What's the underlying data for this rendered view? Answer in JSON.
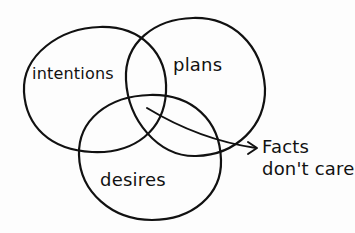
{
  "diagram": {
    "type": "venn",
    "circles": [
      {
        "id": "intentions",
        "label": "intentions"
      },
      {
        "id": "plans",
        "label": "plans"
      },
      {
        "id": "desires",
        "label": "desires"
      }
    ],
    "callout": {
      "line1": "Facts",
      "line2": "don't care",
      "points_to": "center overlap of intentions, plans and desires"
    },
    "colors": {
      "stroke": "#111111",
      "background": "#fdfdfd"
    }
  }
}
